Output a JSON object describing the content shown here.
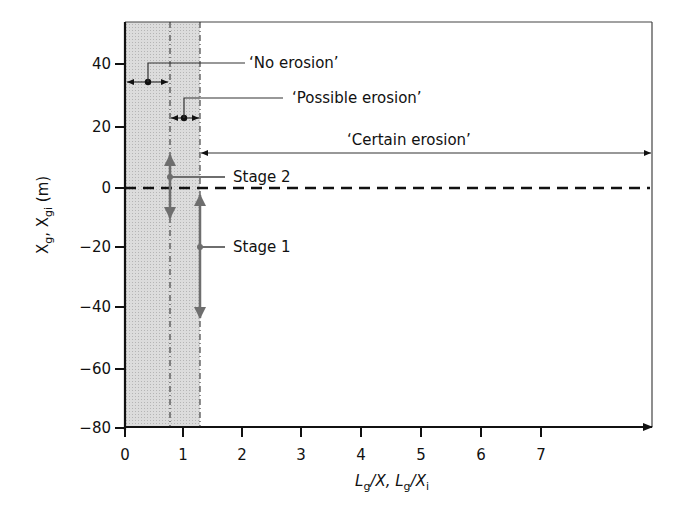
{
  "diagram": {
    "y_axis": {
      "label_main": "X",
      "label_sub1": "g",
      "label_sep": ", X",
      "label_sub2": "gi",
      "label_unit": " (m)",
      "ticks": [
        "40",
        "20",
        "0",
        "−20",
        "−40",
        "−60",
        "−80"
      ],
      "tick_values": [
        40,
        20,
        0,
        -20,
        -40,
        -60,
        -80
      ],
      "range": [
        -80,
        50
      ]
    },
    "x_axis": {
      "label_L1": "L",
      "label_sub1": "g",
      "label_mid": "/X, ",
      "label_L2": "L",
      "label_sub2": "g",
      "label_mid2": "/X",
      "label_sub3": "i",
      "ticks": [
        "0",
        "1",
        "2",
        "3",
        "4",
        "5",
        "6",
        "7"
      ],
      "tick_values": [
        0,
        1,
        2,
        3,
        4,
        5,
        6,
        7
      ]
    },
    "zones": [
      {
        "name": "No erosion",
        "label": "‘No erosion’",
        "from": 0,
        "to": 0.75
      },
      {
        "name": "Possible erosion",
        "label": "‘Possible erosion’",
        "from": 0.75,
        "to": 1.25
      },
      {
        "name": "Certain erosion",
        "label": "‘Certain erosion’",
        "from": 1.25,
        "to": "∞"
      }
    ],
    "stages": [
      {
        "label": "Stage 2",
        "x": 0.75,
        "y_range": [
          -10,
          10
        ]
      },
      {
        "label": "Stage 1",
        "x": 1.25,
        "y_range": [
          -43,
          2
        ]
      }
    ],
    "reference_line": {
      "y": 0,
      "style": "dashed"
    },
    "colors": {
      "shaded_zone": "#d9d9d9",
      "axis": "#111111",
      "stage_arrow": "#6e6e6e",
      "dashed": "#111111"
    }
  }
}
